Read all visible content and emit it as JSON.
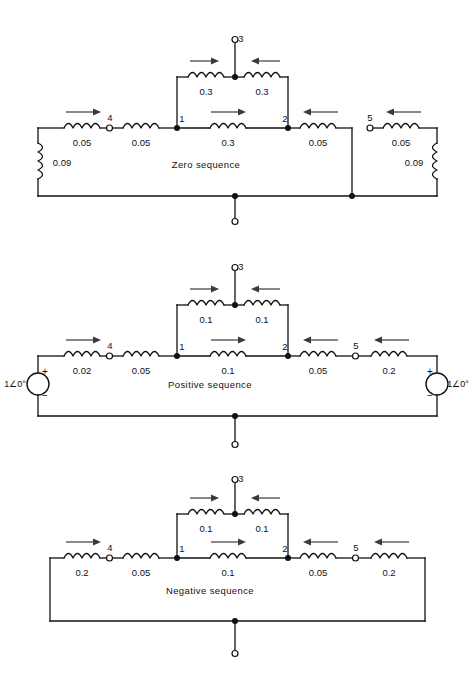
{
  "figure": {
    "type": "circuit-diagram",
    "caption": ""
  },
  "common": {
    "node_labels": {
      "n1": "1",
      "n2": "2",
      "n3": "3",
      "n4": "4",
      "n5": "5"
    },
    "polarity_plus": "+",
    "polarity_minus": "−"
  },
  "networks": [
    {
      "id": "zero",
      "title": "Zero sequence",
      "source_left": null,
      "source_right": null,
      "left_shunt_label": "0.09",
      "right_shunt_label": "0.09",
      "branches": {
        "left_outer": "0.05",
        "left_inner": "0.05",
        "middle": "0.3",
        "right_inner": "0.05",
        "right_outer": "0.05",
        "tee_left": "0.3",
        "tee_right": "0.3"
      }
    },
    {
      "id": "positive",
      "title": "Positive sequence",
      "source_left": "1∠0°",
      "source_right": "1∠0°",
      "left_shunt_label": null,
      "right_shunt_label": null,
      "branches": {
        "left_outer": "0.02",
        "left_inner": "0.05",
        "middle": "0.1",
        "right_inner": "0.05",
        "right_outer": "0.2",
        "tee_left": "0.1",
        "tee_right": "0.1"
      }
    },
    {
      "id": "negative",
      "title": "Negative sequence",
      "source_left": null,
      "source_right": null,
      "left_shunt_label": null,
      "right_shunt_label": null,
      "branches": {
        "left_outer": "0.2",
        "left_inner": "0.05",
        "middle": "0.1",
        "right_inner": "0.05",
        "right_outer": "0.2",
        "tee_left": "0.1",
        "tee_right": "0.1"
      }
    }
  ],
  "colors": {
    "line": "#111111",
    "arrow": "#3a3a3a",
    "background": "#ffffff"
  }
}
